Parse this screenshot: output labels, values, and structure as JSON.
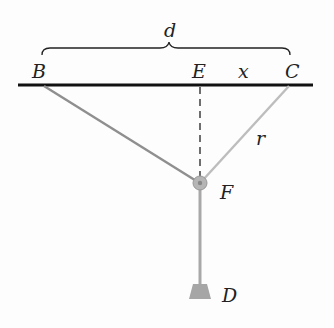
{
  "diagram": {
    "labels": {
      "d": "d",
      "B": "B",
      "E": "E",
      "x": "x",
      "C": "C",
      "r": "r",
      "F": "F",
      "D": "D"
    },
    "colors": {
      "beam": "#111111",
      "cable": "#9a9a9a",
      "cable_light": "#b8b8b8",
      "pulley": "#a8a8a8",
      "weight": "#a6a6a6"
    }
  }
}
